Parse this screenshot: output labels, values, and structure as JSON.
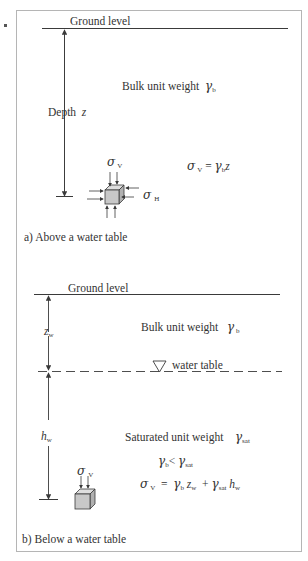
{
  "figure": {
    "border_color": "#b5b5b5",
    "line_color": "#3a3a3a",
    "cube_fill": "#c8c8c8",
    "panel_a": {
      "ground_label": "Ground level",
      "depth_label": "Depth",
      "depth_var": "z",
      "bulk_label": "Bulk unit weight",
      "gamma": "γ",
      "gamma_sub_b": "b",
      "sigma": "σ",
      "sub_v": "V",
      "sub_h": "H",
      "equation_eq": "=",
      "equation_z": "z",
      "caption": "a) Above a water table"
    },
    "panel_b": {
      "ground_label": "Ground level",
      "zw_var": "z",
      "zw_sub": "w",
      "bulk_label": "Bulk unit weight",
      "gamma": "γ",
      "gamma_sub_b": "b",
      "water_table_label": "water table",
      "hw_var": "h",
      "hw_sub": "w",
      "sat_label": "Saturated unit weight",
      "gamma_sub_sat": "sat",
      "less_than": "<",
      "sigma": "σ",
      "sub_v": "V",
      "equation_eq": "=",
      "equation_plus": "+",
      "caption": "b)  Below a water table"
    }
  }
}
